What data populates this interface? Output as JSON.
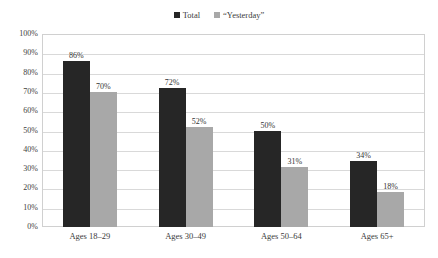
{
  "chart_data": {
    "type": "bar",
    "title": "",
    "xlabel": "",
    "ylabel": "",
    "categories": [
      "Ages 18–29",
      "Ages 30–49",
      "Ages 50–64",
      "Ages 65+"
    ],
    "series": [
      {
        "name": "Total",
        "color": "#262626",
        "values": [
          86,
          72,
          50,
          34
        ],
        "labels": [
          "86%",
          "72%",
          "50%",
          "34%"
        ]
      },
      {
        "name": "“Yesterday”",
        "color": "#a8a8a8",
        "values": [
          70,
          52,
          31,
          18
        ],
        "labels": [
          "70%",
          "52%",
          "31%",
          "18%"
        ]
      }
    ],
    "ylim": [
      0,
      100
    ],
    "y_ticks": [
      "100%",
      "90%",
      "80%",
      "70%",
      "60%",
      "50%",
      "40%",
      "30%",
      "20%",
      "10%",
      "0%"
    ],
    "y_tick_values": [
      100,
      90,
      80,
      70,
      60,
      50,
      40,
      30,
      20,
      10,
      0
    ],
    "grid": true,
    "legend_position": "top-center",
    "value_labels": true,
    "gridline_color": "#d9d9d9",
    "plot_border_color": "#d0d0d0",
    "background_color": "#ffffff"
  },
  "legend": {
    "entries": [
      {
        "label": "Total",
        "color": "#262626"
      },
      {
        "label": "“Yesterday”",
        "color": "#a8a8a8"
      }
    ]
  }
}
